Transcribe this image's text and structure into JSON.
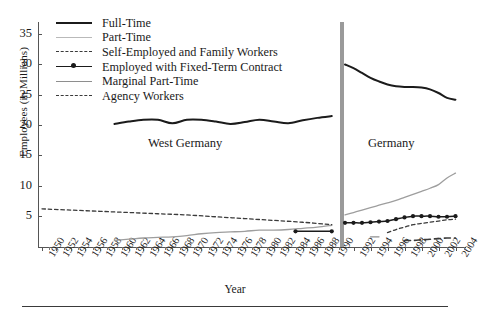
{
  "axes": {
    "ylabel": "Employees (in Millions)",
    "xlabel": "Year",
    "yticks": [
      35,
      30,
      25,
      20,
      15,
      10,
      5
    ],
    "ylim": [
      0,
      37
    ],
    "xticks_west": [
      1950,
      1952,
      1954,
      1956,
      1958,
      1960,
      1962,
      1964,
      1966,
      1968,
      1970,
      1972,
      1974,
      1976,
      1978,
      1980,
      1982,
      1984,
      1986,
      1988,
      1990
    ],
    "xticks_germany": [
      1992,
      1994,
      1996,
      1998,
      2000,
      2002,
      2004
    ]
  },
  "legend": {
    "position": "top-left",
    "items": [
      {
        "label": "Full-Time",
        "key": "solid-black-thick",
        "color": "#1b1b1b"
      },
      {
        "label": "Part-Time",
        "key": "solid-lightgray",
        "color": "#b9b9b9"
      },
      {
        "label": "Self-Employed and Family Workers",
        "key": "dashed-short",
        "color": "#3a3a3a"
      },
      {
        "label": "Employed with Fixed-Term Contract",
        "key": "solid-with-marker",
        "color": "#1b1b1b"
      },
      {
        "label": "Marginal Part-Time",
        "key": "solid-gray",
        "color": "#8e8e8e"
      },
      {
        "label": "Agency Workers",
        "key": "dashed-long",
        "color": "#3a3a3a"
      }
    ]
  },
  "annotations": {
    "west_germany": "West Germany",
    "germany": "Germany"
  },
  "chart_data": {
    "type": "line",
    "title": "",
    "xlabel": "Year",
    "ylabel": "Employees (in Millions)",
    "ylim": [
      0,
      37
    ],
    "grid": false,
    "legend_position": "top-left",
    "panels": [
      {
        "name": "West Germany",
        "xlim": [
          1950,
          1991
        ],
        "series": [
          {
            "name": "Full-Time",
            "x": [
              1960,
              1962,
              1964,
              1966,
              1968,
              1970,
              1972,
              1974,
              1976,
              1978,
              1980,
              1982,
              1984,
              1986,
              1988,
              1990
            ],
            "values": [
              20.2,
              20.6,
              20.9,
              20.9,
              20.3,
              20.9,
              20.9,
              20.6,
              20.2,
              20.5,
              20.9,
              20.6,
              20.3,
              20.8,
              21.2,
              21.5
            ]
          },
          {
            "name": "Part-Time",
            "x": [
              1960,
              1962,
              1964,
              1966,
              1968,
              1970,
              1972,
              1974,
              1976,
              1978,
              1980,
              1982,
              1984,
              1986,
              1988,
              1990
            ],
            "values": [
              1.0,
              1.2,
              1.4,
              1.5,
              1.6,
              1.8,
              2.1,
              2.3,
              2.4,
              2.5,
              2.7,
              2.7,
              2.8,
              3.0,
              3.2,
              3.5
            ]
          },
          {
            "name": "Self-Employed and Family Workers",
            "x": [
              1950,
              1954,
              1958,
              1962,
              1966,
              1970,
              1974,
              1978,
              1982,
              1986,
              1990
            ],
            "values": [
              6.2,
              6.0,
              5.8,
              5.6,
              5.4,
              5.2,
              4.9,
              4.6,
              4.3,
              4.0,
              3.6
            ]
          },
          {
            "name": "Employed with Fixed-Term Contract",
            "x": [
              1985,
              1990
            ],
            "values": [
              2.5,
              2.5
            ]
          },
          {
            "name": "Marginal Part-Time",
            "x": [],
            "values": []
          },
          {
            "name": "Agency Workers",
            "x": [],
            "values": []
          }
        ]
      },
      {
        "name": "Germany",
        "xlim": [
          1991,
          2005
        ],
        "series": [
          {
            "name": "Full-Time",
            "x": [
              1991,
              1992,
              1993,
              1994,
              1995,
              1996,
              1997,
              1998,
              1999,
              2000,
              2001,
              2002,
              2003,
              2004
            ],
            "values": [
              30.0,
              29.4,
              28.6,
              27.8,
              27.2,
              26.7,
              26.4,
              26.3,
              26.3,
              26.2,
              25.9,
              25.3,
              24.5,
              24.2
            ]
          },
          {
            "name": "Part-Time",
            "x": [
              1991,
              1992,
              1993,
              1994,
              1995,
              1996,
              1997,
              1998,
              1999,
              2000,
              2001,
              2002,
              2003,
              2004
            ],
            "values": [
              5.2,
              5.6,
              6.0,
              6.4,
              6.8,
              7.2,
              7.6,
              8.1,
              8.6,
              9.1,
              9.6,
              10.2,
              11.3,
              12.1
            ]
          },
          {
            "name": "Employed with Fixed-Term Contract",
            "x": [
              1991,
              1992,
              1993,
              1994,
              1995,
              1996,
              1997,
              1998,
              1999,
              2000,
              2001,
              2002,
              2003,
              2004
            ],
            "values": [
              3.9,
              3.9,
              3.9,
              4.0,
              4.1,
              4.2,
              4.5,
              4.8,
              5.0,
              5.0,
              5.0,
              4.9,
              4.9,
              5.0
            ]
          },
          {
            "name": "Self-Employed and Family Workers",
            "x": [
              1996,
              1997,
              1998,
              1999,
              2000,
              2001,
              2002,
              2003,
              2004
            ],
            "values": [
              2.3,
              2.8,
              3.2,
              3.6,
              3.8,
              4.0,
              4.2,
              4.4,
              4.5
            ]
          },
          {
            "name": "Marginal Part-Time",
            "x": [
              1994,
              1995
            ],
            "values": [
              1.6,
              1.6
            ]
          },
          {
            "name": "Agency Workers",
            "x": [
              1998,
              1999,
              2000,
              2001,
              2002,
              2003,
              2004
            ],
            "values": [
              1.0,
              1.0,
              1.1,
              1.2,
              1.3,
              1.4,
              1.4
            ]
          }
        ]
      }
    ]
  }
}
